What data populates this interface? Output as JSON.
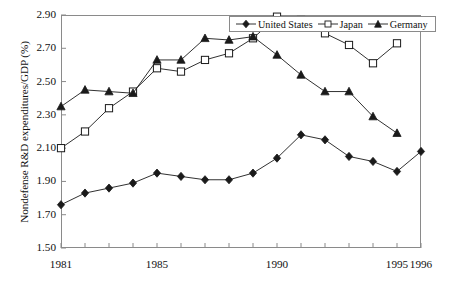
{
  "chart_data": {
    "type": "line",
    "title": "",
    "xlabel": "",
    "ylabel": "Nondefense R&D expenditures/GDP (%)",
    "xlim": [
      1981,
      1996
    ],
    "ylim": [
      1.5,
      2.9
    ],
    "grid": false,
    "legend_position": "top-right",
    "x_ticks_all": [
      1981,
      1982,
      1983,
      1984,
      1985,
      1986,
      1987,
      1988,
      1989,
      1990,
      1991,
      1992,
      1993,
      1994,
      1995,
      1996
    ],
    "x_tick_labels": [
      "1981",
      "1985",
      "1990",
      "1995",
      "1996"
    ],
    "x_tick_label_values": [
      1981,
      1985,
      1990,
      1995,
      1996
    ],
    "y_ticks": [
      1.5,
      1.7,
      1.9,
      2.1,
      2.3,
      2.5,
      2.7,
      2.9
    ],
    "y_tick_labels": [
      "1.50",
      "1.70",
      "1.90",
      "2.10",
      "2.30",
      "2.50",
      "2.70",
      "2.90"
    ],
    "series": [
      {
        "name": "United States",
        "marker": "filled-diamond",
        "color": "#1a1a1a",
        "x": [
          1981,
          1982,
          1983,
          1984,
          1985,
          1986,
          1987,
          1988,
          1989,
          1990,
          1991,
          1992,
          1993,
          1994,
          1995,
          1996
        ],
        "values": [
          1.76,
          1.83,
          1.86,
          1.89,
          1.95,
          1.93,
          1.91,
          1.91,
          1.95,
          2.04,
          2.18,
          2.15,
          2.05,
          2.02,
          1.96,
          2.08
        ]
      },
      {
        "name": "Japan",
        "marker": "open-square",
        "color": "#1a1a1a",
        "x": [
          1981,
          1982,
          1983,
          1984,
          1985,
          1986,
          1987,
          1988,
          1989,
          1990,
          1991,
          1992,
          1993,
          1994,
          1995
        ],
        "values": [
          2.1,
          2.2,
          2.34,
          2.44,
          2.58,
          2.56,
          2.63,
          2.67,
          2.76,
          2.89,
          2.87,
          2.79,
          2.72,
          2.61,
          2.73
        ]
      },
      {
        "name": "Germany",
        "marker": "filled-triangle",
        "color": "#1a1a1a",
        "x": [
          1981,
          1982,
          1983,
          1984,
          1985,
          1986,
          1987,
          1988,
          1989,
          1990,
          1991,
          1992,
          1993,
          1994,
          1995
        ],
        "values": [
          2.35,
          2.45,
          2.44,
          2.43,
          2.63,
          2.63,
          2.76,
          2.75,
          2.77,
          2.66,
          2.54,
          2.44,
          2.44,
          2.29,
          2.19
        ]
      }
    ]
  },
  "legend": {
    "items": [
      {
        "label": "United States"
      },
      {
        "label": "Japan"
      },
      {
        "label": "Germany"
      }
    ]
  }
}
